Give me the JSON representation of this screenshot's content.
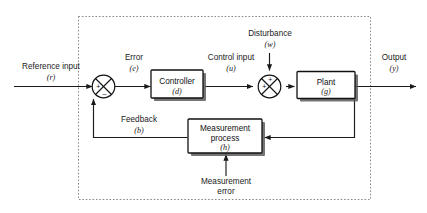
{
  "diagram": {
    "type": "control-system-block-diagram",
    "colors": {
      "line": "#1a1a1a",
      "box_fill": "#ffffff",
      "box_stroke": "#111111",
      "shadow": "#575757",
      "dashed_border": "#8a8a8a",
      "background": "#ffffff"
    },
    "signals": {
      "reference_input": {
        "label": "Reference input",
        "symbol": "(r)"
      },
      "error": {
        "label": "Error",
        "symbol": "(e)"
      },
      "control_input": {
        "label": "Control input",
        "symbol": "(u)"
      },
      "disturbance": {
        "label": "Disturbance",
        "symbol": "(w)"
      },
      "output": {
        "label": "Output",
        "symbol": "(y)"
      },
      "feedback": {
        "label": "Feedback",
        "symbol": "(b)"
      },
      "measurement_error": {
        "label_line1": "Measurement",
        "label_line2": "error"
      }
    },
    "blocks": {
      "controller": {
        "label": "Controller",
        "symbol": "(d)"
      },
      "plant": {
        "label": "Plant",
        "symbol": "(g)"
      },
      "measurement_process": {
        "label_line1": "Measurement",
        "label_line2": "process",
        "symbol": "(h)"
      }
    },
    "summing_junctions": {
      "error_junction": {
        "sign_left": "+",
        "sign_bottom": "–"
      },
      "disturbance_junction": {
        "sign_left": "+",
        "sign_top": "+"
      }
    }
  }
}
